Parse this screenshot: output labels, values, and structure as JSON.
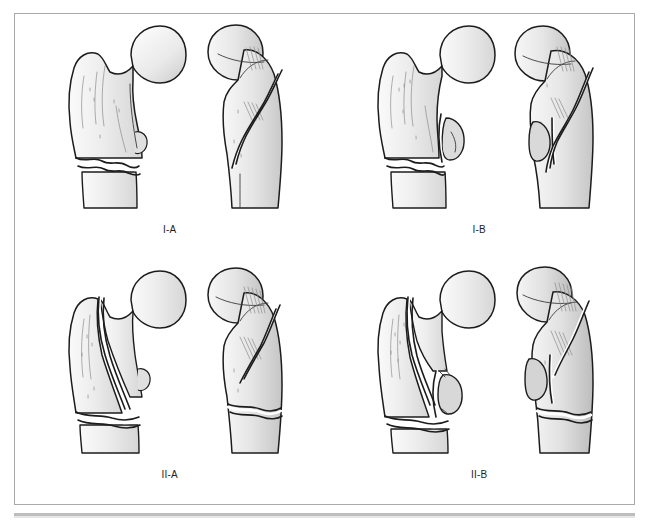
{
  "figure": {
    "panels": [
      {
        "id": "type-1-a",
        "label": "I-A",
        "views": [
          "anterior",
          "lateral"
        ]
      },
      {
        "id": "type-1-b",
        "label": "I-B",
        "views": [
          "anterior",
          "lateral"
        ]
      },
      {
        "id": "type-2-a",
        "label": "II-A",
        "views": [
          "anterior",
          "lateral"
        ]
      },
      {
        "id": "type-2-b",
        "label": "II-B",
        "views": [
          "anterior",
          "lateral"
        ]
      }
    ],
    "colors": {
      "outline": "#1c1c1c",
      "bone_fill_light": "#f3f3f3",
      "bone_fill_mid": "#e4e4e4",
      "bone_fill_shadow": "#cfcfcf",
      "frame_border": "#a9a9a9",
      "band": "#bdbdbd",
      "label_text": "#231f20",
      "background": "#ffffff"
    }
  }
}
